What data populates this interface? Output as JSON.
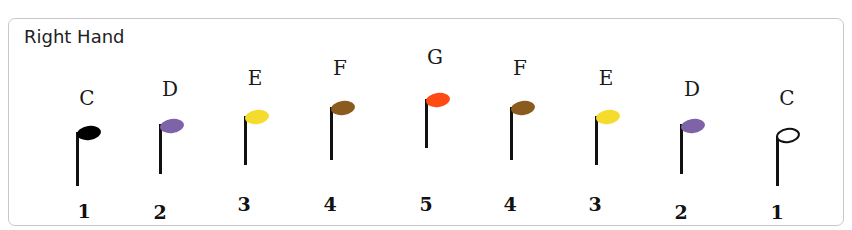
{
  "title": "Right Hand",
  "notes": [
    {
      "name": "C",
      "finger": "1",
      "color": "#000000",
      "filled": true
    },
    {
      "name": "D",
      "finger": "2",
      "color": "#7e63a8",
      "filled": true
    },
    {
      "name": "E",
      "finger": "3",
      "color": "#f5dc2c",
      "filled": true
    },
    {
      "name": "F",
      "finger": "4",
      "color": "#8a5a1e",
      "filled": true
    },
    {
      "name": "G",
      "finger": "5",
      "color": "#ff4a14",
      "filled": true
    },
    {
      "name": "F",
      "finger": "4",
      "color": "#8a5a1e",
      "filled": true
    },
    {
      "name": "E",
      "finger": "3",
      "color": "#f5dc2c",
      "filled": true
    },
    {
      "name": "D",
      "finger": "2",
      "color": "#7e63a8",
      "filled": true
    },
    {
      "name": "C",
      "finger": "1",
      "color": "#ffffff",
      "filled": false
    }
  ]
}
